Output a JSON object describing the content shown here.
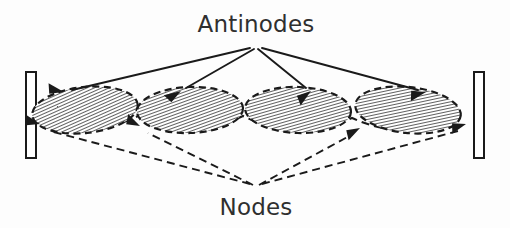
{
  "figure": {
    "title_label": "Antinodes",
    "bottom_label": "Nodes",
    "background_color": "#fdfdfd",
    "ink_color": "#1a1a1a",
    "text_color": "#2f2f2f"
  },
  "labels": {
    "antinodes": {
      "text": "Antinodes",
      "x": 256,
      "y": 32
    },
    "nodes": {
      "text": "Nodes",
      "x": 256,
      "y": 215
    }
  },
  "walls": [
    {
      "name": "left-wall",
      "x": 26,
      "y": 72,
      "width": 10,
      "height": 86
    },
    {
      "name": "right-wall",
      "x": 474,
      "y": 72,
      "width": 10,
      "height": 86
    }
  ],
  "antinode_apex": {
    "x": 256,
    "y": 46
  },
  "node_apex": {
    "x": 256,
    "y": 186
  },
  "lobes": [
    {
      "name": "antinode-lobe-1",
      "cx": 85,
      "cy": 110,
      "rx": 53,
      "ry": 23,
      "tilt": -6
    },
    {
      "name": "antinode-lobe-2",
      "cx": 190,
      "cy": 110,
      "rx": 53,
      "ry": 23,
      "tilt": -2
    },
    {
      "name": "antinode-lobe-3",
      "cx": 298,
      "cy": 110,
      "rx": 53,
      "ry": 23,
      "tilt": 2
    },
    {
      "name": "antinode-lobe-4",
      "cx": 408,
      "cy": 110,
      "rx": 53,
      "ry": 23,
      "tilt": 6
    }
  ],
  "antinode_arrows": [
    {
      "name": "antinode-arrow-1",
      "x1": 250,
      "y1": 48,
      "x2": 64,
      "y2": 92,
      "angle": 193
    },
    {
      "name": "antinode-arrow-2",
      "x1": 254,
      "y1": 49,
      "x2": 181,
      "y2": 91,
      "angle": 150
    },
    {
      "name": "antinode-arrow-3",
      "x1": 258,
      "y1": 49,
      "x2": 311,
      "y2": 91,
      "angle": 38
    },
    {
      "name": "antinode-arrow-4",
      "x1": 262,
      "y1": 48,
      "x2": 426,
      "y2": 92,
      "angle": 15
    }
  ],
  "node_arrows": [
    {
      "name": "node-arrow-1",
      "x1": 250,
      "y1": 184,
      "x2": 42,
      "y2": 126,
      "angle": 196
    },
    {
      "name": "node-arrow-2",
      "x1": 253,
      "y1": 185,
      "x2": 142,
      "y2": 126,
      "angle": 208
    },
    {
      "name": "node-arrow-3",
      "x1": 259,
      "y1": 185,
      "x2": 358,
      "y2": 128,
      "angle": 330
    },
    {
      "name": "node-arrow-4",
      "x1": 262,
      "y1": 184,
      "x2": 464,
      "y2": 126,
      "angle": 342
    }
  ],
  "envelope_nodes_x": [
    36,
    138,
    243,
    352,
    460
  ],
  "hatch": {
    "angle": 72,
    "spacing": 3,
    "line_width": 1.5,
    "color": "#2a2a2a"
  }
}
